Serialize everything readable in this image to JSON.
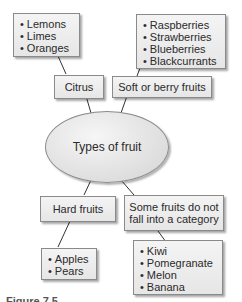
{
  "diagram": {
    "center": {
      "label": "Types of fruit"
    },
    "categories": [
      {
        "id": "citrus",
        "label": "Citrus",
        "items": [
          "Lemons",
          "Limes",
          "Oranges"
        ]
      },
      {
        "id": "soft",
        "label": "Soft or berry fruits",
        "items": [
          "Raspberries",
          "Strawberries",
          "Blueberries",
          "Blackcurrants"
        ]
      },
      {
        "id": "hard",
        "label": "Hard fruits",
        "items": [
          "Apples",
          "Pears"
        ]
      },
      {
        "id": "other",
        "label_line1": "Some fruits do not",
        "label_line2": "fall into a category",
        "items": [
          "Kiwi",
          "Pomegranate",
          "Melon",
          "Banana"
        ]
      }
    ]
  },
  "caption": "Figure 7.5"
}
